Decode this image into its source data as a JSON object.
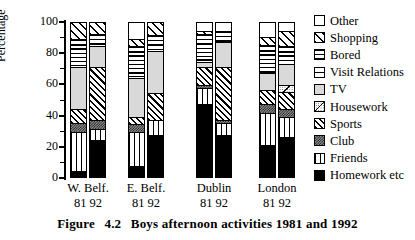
{
  "figure": {
    "caption_label": "Figure",
    "caption_number": "4.2",
    "caption_text": "Boys  afternoon  activities  1981  and  1992"
  },
  "axes": {
    "ylabel": "Percentage",
    "yticks": [
      "0",
      "20",
      "40",
      "60",
      "80",
      "100"
    ],
    "ylim_min": 0,
    "ylim_max": 100,
    "grid": false
  },
  "groups": [
    {
      "name": "W. Belf.",
      "years": "81  92"
    },
    {
      "name": "E. Belf.",
      "years": "81  92"
    },
    {
      "name": "Dublin",
      "years": "81  92"
    },
    {
      "name": "London",
      "years": "81  92"
    }
  ],
  "legend": {
    "position": "right",
    "items": [
      {
        "label": "Other",
        "pattern": "white",
        "key": "other"
      },
      {
        "label": "Shopping",
        "pattern": "diagonal-hatch-sparse",
        "key": "shopping"
      },
      {
        "label": "Bored",
        "pattern": "horizontal-lines",
        "key": "bored"
      },
      {
        "label": "Visit Relations",
        "pattern": "single-horizontal-line",
        "key": "visit_relations"
      },
      {
        "label": "TV",
        "pattern": "light-gray-stipple",
        "key": "tv"
      },
      {
        "label": "Housework",
        "pattern": "dots-with-diagonal",
        "key": "housework"
      },
      {
        "label": "Sports",
        "pattern": "diagonal-hatch-dense",
        "key": "sports"
      },
      {
        "label": "Club",
        "pattern": "checkerboard",
        "key": "club"
      },
      {
        "label": "Friends",
        "pattern": "vertical-lines",
        "key": "friends"
      },
      {
        "label": "Homework etc",
        "pattern": "solid-black",
        "key": "homework"
      }
    ]
  },
  "chart_data": {
    "type": "bar",
    "stacked": true,
    "title": "Boys afternoon activities 1981 and 1992",
    "xlabel": "",
    "ylabel": "Percentage",
    "ylim": [
      0,
      100
    ],
    "categories": [
      "W. Belf. 81",
      "W. Belf. 92",
      "E. Belf. 81",
      "E. Belf. 92",
      "Dublin 81",
      "Dublin 92",
      "London 81",
      "London 92"
    ],
    "series": [
      {
        "name": "Homework etc",
        "key": "homework",
        "values": [
          5,
          25,
          8,
          28,
          48,
          28,
          22,
          27
        ]
      },
      {
        "name": "Friends",
        "key": "friends",
        "values": [
          25,
          7,
          22,
          10,
          10,
          8,
          20,
          13
        ]
      },
      {
        "name": "Club",
        "key": "club",
        "values": [
          6,
          6,
          5,
          0,
          2,
          2,
          6,
          5
        ]
      },
      {
        "name": "Sports",
        "key": "sports",
        "values": [
          9,
          34,
          5,
          17,
          12,
          34,
          9,
          11
        ]
      },
      {
        "name": "Housework",
        "key": "housework",
        "values": [
          0,
          0,
          0,
          0,
          0,
          0,
          0,
          4
        ]
      },
      {
        "name": "TV",
        "key": "tv",
        "values": [
          27,
          13,
          25,
          27,
          3,
          16,
          11,
          14
        ]
      },
      {
        "name": "Visit Relations",
        "key": "visit_relations",
        "values": [
          0,
          0,
          3,
          0,
          4,
          0,
          0,
          0
        ]
      },
      {
        "name": "Bored",
        "key": "bored",
        "values": [
          18,
          8,
          17,
          10,
          14,
          7,
          18,
          11
        ]
      },
      {
        "name": "Shopping",
        "key": "shopping",
        "values": [
          10,
          7,
          5,
          8,
          2,
          0,
          5,
          10
        ]
      },
      {
        "name": "Other",
        "key": "other",
        "values": [
          0,
          0,
          10,
          0,
          5,
          5,
          9,
          5
        ]
      }
    ]
  },
  "bars_layout": {
    "left_positions": [
      70,
      89,
      128,
      147,
      196,
      215,
      259,
      278
    ],
    "width": 17
  }
}
